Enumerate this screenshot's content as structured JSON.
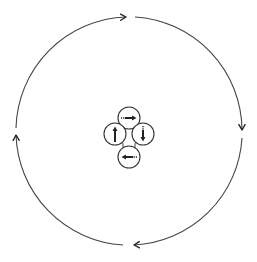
{
  "diagram": {
    "title": "Clockwise cycle diagram",
    "colors": {
      "background": "#ffffff",
      "stroke": "#333333",
      "arrow_fill": "#222222"
    },
    "outer_cycle": {
      "center": [
        129,
        131
      ],
      "radius": 114,
      "direction": "clockwise",
      "arcs": [
        {
          "id": "top-left-arc",
          "from": "left",
          "to": "top",
          "arrow_direction": "right"
        },
        {
          "id": "top-right-arc",
          "from": "top",
          "to": "right",
          "arrow_direction": "down"
        },
        {
          "id": "bottom-right-arc",
          "from": "right",
          "to": "bottom",
          "arrow_direction": "left"
        },
        {
          "id": "bottom-left-arc",
          "from": "bottom",
          "to": "left",
          "arrow_direction": "up"
        }
      ]
    },
    "inner_cluster": {
      "direction": "clockwise",
      "nodes": [
        {
          "id": "top-node",
          "center": [
            129,
            118
          ],
          "radius": 11,
          "arrow": "right"
        },
        {
          "id": "right-node",
          "center": [
            143,
            133
          ],
          "radius": 11,
          "arrow": "down"
        },
        {
          "id": "bottom-node",
          "center": [
            129,
            157
          ],
          "radius": 11,
          "arrow": "left"
        },
        {
          "id": "left-node",
          "center": [
            115,
            133
          ],
          "radius": 11,
          "arrow": "up"
        }
      ]
    }
  }
}
